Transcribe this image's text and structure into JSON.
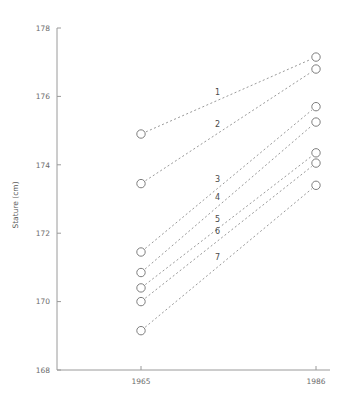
{
  "chart_data": {
    "type": "line",
    "title": "",
    "subtitle": "",
    "xlabel": "",
    "ylabel": "Stature (cm)",
    "x": [
      1965,
      1986
    ],
    "categories": [
      "1965",
      "1986"
    ],
    "xtick_labels": [
      "1965",
      "1986"
    ],
    "ytick_labels": [
      "168",
      "170",
      "172",
      "174",
      "176",
      "178"
    ],
    "yticks": [
      168,
      170,
      172,
      174,
      176,
      178
    ],
    "ylim": [
      168,
      178
    ],
    "xlim": [
      1965,
      1986
    ],
    "grid": false,
    "legend": "inline-series-labels",
    "marker": "open-circle",
    "linestyle": "dotted",
    "series": [
      {
        "name": "1",
        "label": "1",
        "values": [
          174.9,
          177.15
        ]
      },
      {
        "name": "2",
        "label": "2",
        "values": [
          173.45,
          176.8
        ]
      },
      {
        "name": "3",
        "label": "3",
        "values": [
          171.45,
          175.7
        ]
      },
      {
        "name": "4",
        "label": "4",
        "values": [
          170.85,
          175.25
        ]
      },
      {
        "name": "5",
        "label": "5",
        "values": [
          170.4,
          174.35
        ]
      },
      {
        "name": "6",
        "label": "6",
        "values": [
          170.0,
          174.05
        ]
      },
      {
        "name": "7",
        "label": "7",
        "values": [
          169.15,
          173.4
        ]
      }
    ],
    "annotations": [
      {
        "text": "1",
        "series": "1"
      },
      {
        "text": "2",
        "series": "2"
      },
      {
        "text": "3",
        "series": "3"
      },
      {
        "text": "4",
        "series": "4"
      },
      {
        "text": "5",
        "series": "5"
      },
      {
        "text": "6",
        "series": "6"
      },
      {
        "text": "7",
        "series": "7"
      }
    ],
    "colors": {
      "background": "#ffffff",
      "axis": "#9a9a9a",
      "line": "#8d8d8d",
      "marker_edge": "#6f6f6f",
      "marker_fill": "#ffffff",
      "text": "#4a4a4a"
    }
  },
  "axes": {
    "y_title": "Stature (cm)",
    "y_ticks": [
      {
        "label": "178",
        "value": 178
      },
      {
        "label": "176",
        "value": 176
      },
      {
        "label": "174",
        "value": 174
      },
      {
        "label": "172",
        "value": 172
      },
      {
        "label": "170",
        "value": 170
      },
      {
        "label": "168",
        "value": 168
      }
    ],
    "x_ticks": [
      {
        "label": "1965",
        "value": 1965
      },
      {
        "label": "1986",
        "value": 1986
      }
    ]
  }
}
